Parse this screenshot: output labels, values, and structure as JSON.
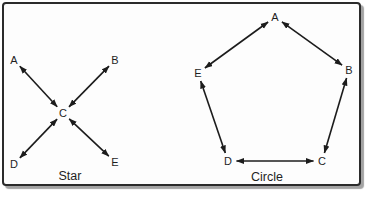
{
  "figure": {
    "background_color": "#fdfdfd",
    "frame_border_color": "#2b2b2b",
    "frame_shadow_color": "#a3a3a3",
    "edge_color": "#1c1c1c",
    "text_color": "#1f1f1f",
    "edge_gap": 8.5
  },
  "diagrams": [
    {
      "name": "star",
      "caption": "Star",
      "caption_pos": {
        "x": 70,
        "y": 176
      },
      "nodes": [
        {
          "label": "A",
          "x": 14,
          "y": 60
        },
        {
          "label": "B",
          "x": 115,
          "y": 60
        },
        {
          "label": "C",
          "x": 63,
          "y": 113
        },
        {
          "label": "D",
          "x": 14,
          "y": 164
        },
        {
          "label": "E",
          "x": 115,
          "y": 162
        }
      ],
      "edges": [
        [
          "A",
          "C"
        ],
        [
          "B",
          "C"
        ],
        [
          "D",
          "C"
        ],
        [
          "E",
          "C"
        ]
      ]
    },
    {
      "name": "circle",
      "caption": "Circle",
      "caption_pos": {
        "x": 267,
        "y": 177
      },
      "nodes": [
        {
          "label": "A",
          "x": 275,
          "y": 17
        },
        {
          "label": "B",
          "x": 349,
          "y": 70
        },
        {
          "label": "C",
          "x": 322,
          "y": 161
        },
        {
          "label": "D",
          "x": 228,
          "y": 161
        },
        {
          "label": "E",
          "x": 198,
          "y": 73
        }
      ],
      "edges": [
        [
          "A",
          "B"
        ],
        [
          "B",
          "C"
        ],
        [
          "C",
          "D"
        ],
        [
          "D",
          "E"
        ],
        [
          "E",
          "A"
        ]
      ]
    }
  ]
}
